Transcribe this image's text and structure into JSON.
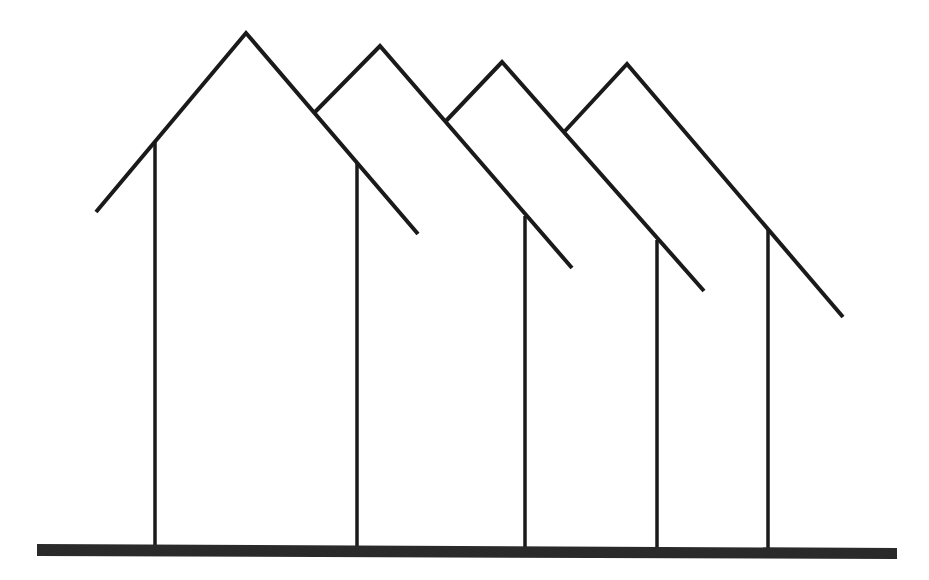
{
  "diagram": {
    "colors": {
      "stroke": "#1a1a1a",
      "ground": "#2a2a2a",
      "background": "#ffffff"
    },
    "roof_count": 4,
    "post_count": 5,
    "roofs": [
      {
        "name": "roof-1"
      },
      {
        "name": "roof-2"
      },
      {
        "name": "roof-3"
      },
      {
        "name": "roof-4"
      }
    ],
    "posts": [
      {
        "name": "post-1"
      },
      {
        "name": "post-2"
      },
      {
        "name": "post-3"
      },
      {
        "name": "post-4"
      },
      {
        "name": "post-5"
      }
    ],
    "ground": {
      "name": "ground-line"
    }
  }
}
